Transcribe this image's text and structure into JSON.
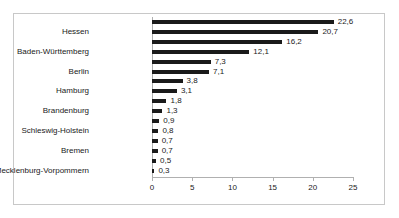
{
  "chart_data": {
    "type": "bar",
    "orientation": "horizontal",
    "title": "",
    "xlabel": "",
    "ylabel": "",
    "xlim": [
      0,
      25
    ],
    "xticks": [
      "0",
      "5",
      "10",
      "15",
      "20",
      "25"
    ],
    "grid": false,
    "legend": null,
    "decimal_separator": ",",
    "bar_color": "#1a1a1a",
    "border_color": "#c8c8c8",
    "axis_color": "#b0b0b0",
    "categories": [
      "",
      "Hessen",
      "",
      "Baden-Württemberg",
      "",
      "Berlin",
      "",
      "Hamburg",
      "",
      "Brandenburg",
      "",
      "Schleswig-Holstein",
      "",
      "Bremen",
      "",
      "Mecklenburg-Vorpommern"
    ],
    "values": [
      22.6,
      20.7,
      16.2,
      12.1,
      7.3,
      7.1,
      3.8,
      3.1,
      1.8,
      1.3,
      0.9,
      0.8,
      0.7,
      0.7,
      0.5,
      0.3
    ],
    "value_labels": [
      "22,6",
      "20,7",
      "16,2",
      "12,1",
      "7,3",
      "7,1",
      "3,8",
      "3,1",
      "1,8",
      "1,3",
      "0,9",
      "0,8",
      "0,7",
      "0,7",
      "0,5",
      "0,3"
    ]
  }
}
